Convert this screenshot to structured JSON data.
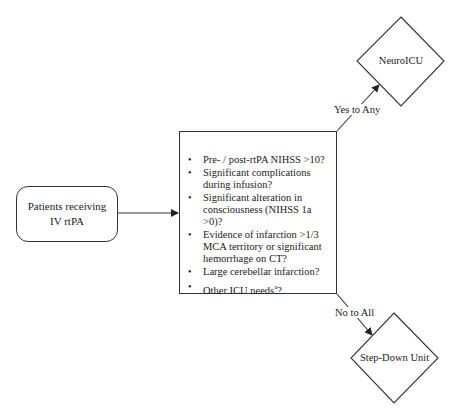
{
  "start_node": {
    "label": "Patients receiving IV rtPA"
  },
  "criteria_node": {
    "items": [
      "Pre- / post-rtPA NIHSS >10?",
      "Significant complications during infusion?",
      "Significant alteration in consciousness (NIHSS 1a >0)?",
      "Evidence of infarction >1/3 MCA territory or significant hemorrhage on CT?",
      "Large cerebellar infarction?",
      "Other ICU needs"
    ],
    "last_item_superscript": "a",
    "last_item_suffix": "?"
  },
  "outcome_yes": {
    "edge_label": "Yes to Any",
    "label": "NeuroICU"
  },
  "outcome_no": {
    "edge_label": "No to All",
    "label": "Step-Down Unit"
  }
}
